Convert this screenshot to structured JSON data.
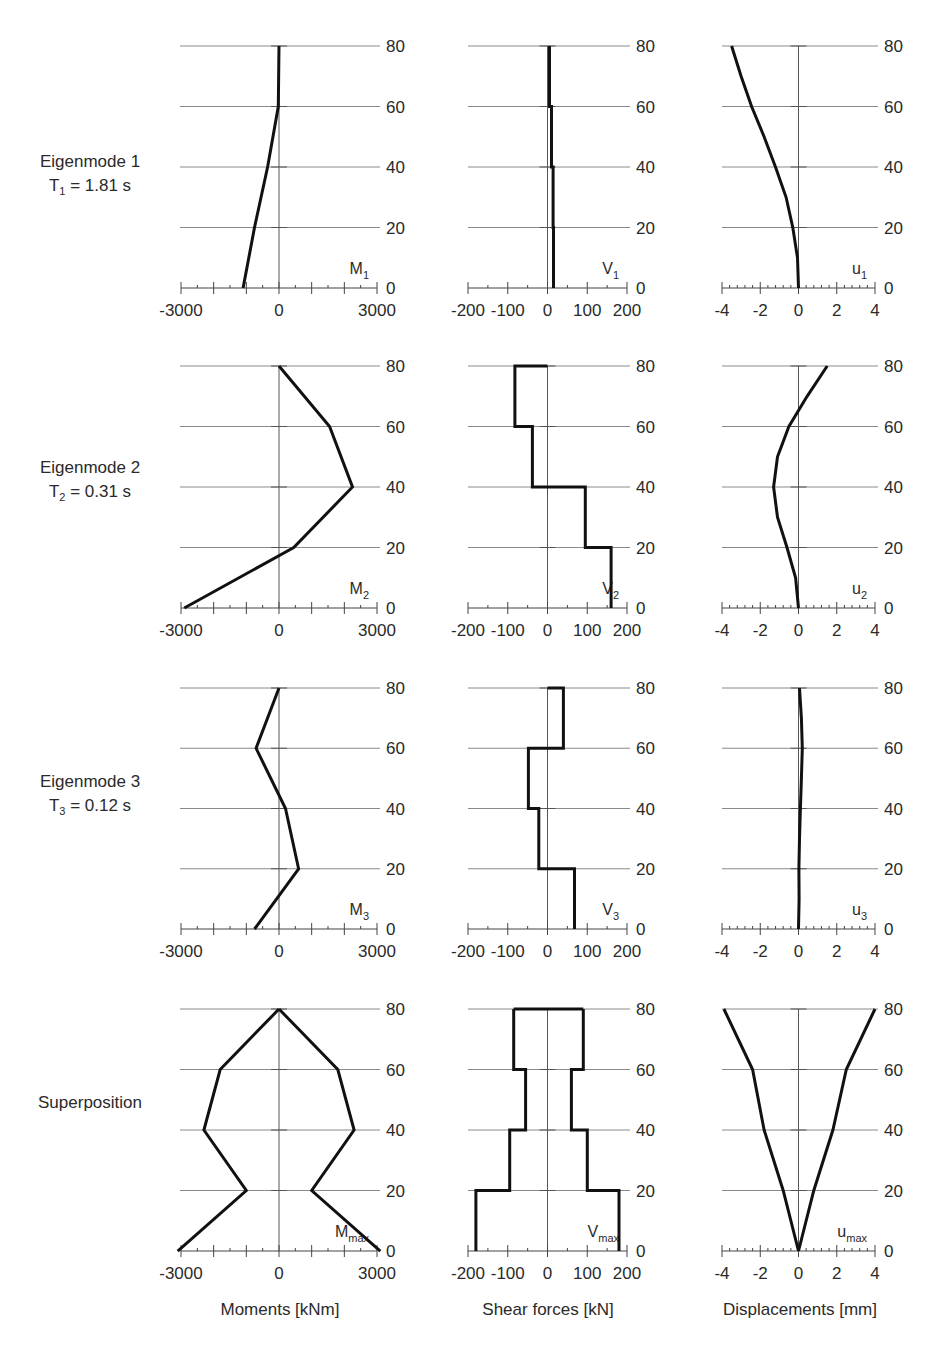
{
  "rows": [
    {
      "title": "Eigenmode 1",
      "period": "T",
      "period_sub": "1",
      "period_value": " = 1.81 s"
    },
    {
      "title": "Eigenmode 2",
      "period": "T",
      "period_sub": "2",
      "period_value": " = 0.31 s"
    },
    {
      "title": "Eigenmode 3",
      "period": "T",
      "period_sub": "3",
      "period_value": " = 0.12 s"
    },
    {
      "title": "Superposition",
      "period": "",
      "period_sub": "",
      "period_value": ""
    }
  ],
  "columns": [
    {
      "title": "Moments [kNm]"
    },
    {
      "title": "Shear forces [kN]"
    },
    {
      "title": "Displacements [mm]"
    }
  ],
  "chart_data": [
    {
      "type": "line",
      "row": 0,
      "col": 0,
      "label": "M",
      "label_sub": "1",
      "xlabel": "",
      "ylabel": "Height",
      "xlim": [
        -3000,
        3000
      ],
      "ylim": [
        0,
        80
      ],
      "xticks": [
        -3000,
        0,
        3000
      ],
      "yticks": [
        0,
        20,
        40,
        60,
        80
      ],
      "grid": true,
      "series": [
        {
          "name": "M1",
          "x": [
            -1100,
            -750,
            -350,
            -20,
            0
          ],
          "y": [
            0,
            20,
            40,
            60,
            80
          ]
        }
      ]
    },
    {
      "type": "line",
      "row": 0,
      "col": 1,
      "label": "V",
      "label_sub": "1",
      "xlim": [
        -200,
        200
      ],
      "ylim": [
        0,
        80
      ],
      "xticks": [
        -200,
        -100,
        0,
        100,
        200
      ],
      "yticks": [
        0,
        20,
        40,
        60,
        80
      ],
      "grid": true,
      "series": [
        {
          "name": "V1",
          "x": [
            15,
            15,
            14,
            14,
            10,
            10,
            5,
            5
          ],
          "y": [
            0,
            20,
            20,
            40,
            40,
            60,
            60,
            80
          ]
        }
      ]
    },
    {
      "type": "line",
      "row": 0,
      "col": 2,
      "label": "u",
      "label_sub": "1",
      "xlim": [
        -4,
        4
      ],
      "ylim": [
        0,
        80
      ],
      "xticks": [
        -4,
        -2,
        0,
        2,
        4
      ],
      "yticks": [
        0,
        20,
        40,
        60,
        80
      ],
      "grid": true,
      "series": [
        {
          "name": "u1",
          "x": [
            0,
            -0.05,
            -0.3,
            -0.65,
            -1.2,
            -1.8,
            -2.45,
            -3.0,
            -3.5
          ],
          "y": [
            0,
            10,
            20,
            30,
            40,
            50,
            60,
            70,
            80
          ]
        }
      ]
    },
    {
      "type": "line",
      "row": 1,
      "col": 0,
      "label": "M",
      "label_sub": "2",
      "xlim": [
        -3000,
        3000
      ],
      "ylim": [
        0,
        80
      ],
      "xticks": [
        -3000,
        0,
        3000
      ],
      "yticks": [
        0,
        20,
        40,
        60,
        80
      ],
      "grid": true,
      "series": [
        {
          "name": "M2",
          "x": [
            -2900,
            450,
            2250,
            1550,
            0
          ],
          "y": [
            0,
            20,
            40,
            60,
            80
          ]
        }
      ]
    },
    {
      "type": "line",
      "row": 1,
      "col": 1,
      "label": "V",
      "label_sub": "2",
      "xlim": [
        -200,
        200
      ],
      "ylim": [
        0,
        80
      ],
      "xticks": [
        -200,
        -100,
        0,
        100,
        200
      ],
      "yticks": [
        0,
        20,
        40,
        60,
        80
      ],
      "grid": true,
      "series": [
        {
          "name": "V2",
          "x": [
            160,
            160,
            95,
            95,
            -38,
            -38,
            -82,
            -82,
            0
          ],
          "y": [
            0,
            20,
            20,
            40,
            40,
            60,
            60,
            80,
            80
          ]
        }
      ]
    },
    {
      "type": "line",
      "row": 1,
      "col": 2,
      "label": "u",
      "label_sub": "2",
      "xlim": [
        -4,
        4
      ],
      "ylim": [
        0,
        80
      ],
      "xticks": [
        -4,
        -2,
        0,
        2,
        4
      ],
      "yticks": [
        0,
        20,
        40,
        60,
        80
      ],
      "grid": true,
      "series": [
        {
          "name": "u2",
          "x": [
            0,
            -0.15,
            -0.6,
            -1.1,
            -1.3,
            -1.1,
            -0.5,
            0.45,
            1.5
          ],
          "y": [
            0,
            10,
            20,
            30,
            40,
            50,
            60,
            70,
            80
          ]
        }
      ]
    },
    {
      "type": "line",
      "row": 2,
      "col": 0,
      "label": "M",
      "label_sub": "3",
      "xlim": [
        -3000,
        3000
      ],
      "ylim": [
        0,
        80
      ],
      "xticks": [
        -3000,
        0,
        3000
      ],
      "yticks": [
        0,
        20,
        40,
        60,
        80
      ],
      "grid": true,
      "series": [
        {
          "name": "M3",
          "x": [
            -750,
            600,
            200,
            -700,
            0
          ],
          "y": [
            0,
            20,
            40,
            60,
            80
          ]
        }
      ]
    },
    {
      "type": "line",
      "row": 2,
      "col": 1,
      "label": "V",
      "label_sub": "3",
      "xlim": [
        -200,
        200
      ],
      "ylim": [
        0,
        80
      ],
      "xticks": [
        -200,
        -100,
        0,
        100,
        200
      ],
      "yticks": [
        0,
        20,
        40,
        60,
        80
      ],
      "grid": true,
      "series": [
        {
          "name": "V3",
          "x": [
            68,
            68,
            -22,
            -22,
            -48,
            -48,
            40,
            40,
            0
          ],
          "y": [
            0,
            20,
            20,
            40,
            40,
            60,
            60,
            80,
            80
          ]
        }
      ]
    },
    {
      "type": "line",
      "row": 2,
      "col": 2,
      "label": "u",
      "label_sub": "3",
      "xlim": [
        -4,
        4
      ],
      "ylim": [
        0,
        80
      ],
      "xticks": [
        -4,
        -2,
        0,
        2,
        4
      ],
      "yticks": [
        0,
        20,
        40,
        60,
        80
      ],
      "grid": true,
      "series": [
        {
          "name": "u3",
          "x": [
            0,
            0.03,
            0.02,
            0.05,
            0.1,
            0.15,
            0.2,
            0.15,
            0.05
          ],
          "y": [
            0,
            10,
            20,
            30,
            40,
            50,
            60,
            70,
            80
          ]
        }
      ]
    },
    {
      "type": "line",
      "row": 3,
      "col": 0,
      "label": "M",
      "label_sub": "max",
      "xlim": [
        -3000,
        3000
      ],
      "ylim": [
        0,
        80
      ],
      "xticks": [
        -3000,
        0,
        3000
      ],
      "yticks": [
        0,
        20,
        40,
        60,
        80
      ],
      "grid": true,
      "series": [
        {
          "name": "Mmax+",
          "x": [
            3100,
            1000,
            2300,
            1800,
            0
          ],
          "y": [
            0,
            20,
            40,
            60,
            80
          ]
        },
        {
          "name": "Mmax-",
          "x": [
            -3100,
            -1000,
            -2300,
            -1800,
            0
          ],
          "y": [
            0,
            20,
            40,
            60,
            80
          ]
        }
      ]
    },
    {
      "type": "line",
      "row": 3,
      "col": 1,
      "label": "V",
      "label_sub": "max",
      "xlim": [
        -200,
        200
      ],
      "ylim": [
        0,
        80
      ],
      "xticks": [
        -200,
        -100,
        0,
        100,
        200
      ],
      "yticks": [
        0,
        20,
        40,
        60,
        80
      ],
      "grid": true,
      "series": [
        {
          "name": "Vmax+",
          "x": [
            180,
            180,
            100,
            100,
            60,
            60,
            90,
            90
          ],
          "y": [
            0,
            20,
            20,
            40,
            40,
            60,
            60,
            80
          ]
        },
        {
          "name": "Vmax-",
          "x": [
            -180,
            -180,
            -95,
            -95,
            -55,
            -55,
            -85,
            -85
          ],
          "y": [
            0,
            20,
            20,
            40,
            40,
            60,
            60,
            80
          ]
        },
        {
          "name": "Vmax-top",
          "x": [
            -85,
            90
          ],
          "y": [
            80,
            80
          ]
        }
      ]
    },
    {
      "type": "line",
      "row": 3,
      "col": 2,
      "label": "u",
      "label_sub": "max",
      "xlim": [
        -4,
        4
      ],
      "ylim": [
        0,
        80
      ],
      "xticks": [
        -4,
        -2,
        0,
        2,
        4
      ],
      "yticks": [
        0,
        20,
        40,
        60,
        80
      ],
      "grid": true,
      "series": [
        {
          "name": "umax+",
          "x": [
            0,
            0.8,
            1.8,
            2.5,
            4.0
          ],
          "y": [
            0,
            20,
            40,
            60,
            80
          ]
        },
        {
          "name": "umax-",
          "x": [
            0,
            -0.8,
            -1.8,
            -2.4,
            -3.9
          ],
          "y": [
            0,
            20,
            40,
            60,
            80
          ]
        }
      ]
    }
  ]
}
